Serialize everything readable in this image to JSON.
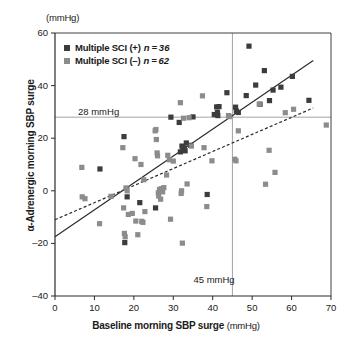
{
  "figure": {
    "unit_top": "(mmHg)",
    "x_axis_title": "Baseline morning SBP surge",
    "x_axis_unit": "(mmHg)",
    "y_axis_title": "α-Adrenergic morning SBP surge"
  },
  "legend": {
    "items": [
      {
        "label": "Multiple SCI (+)",
        "n_text": "n = 36",
        "color": "#3c3c3c",
        "marker": "square-marker"
      },
      {
        "label": "Multiple SCI (–)",
        "n_text": "n = 62",
        "color": "#8c8c8c",
        "marker": "square-marker"
      }
    ]
  },
  "annotations": {
    "h_ref_label": "28 mmHg",
    "v_ref_label": "45 mmHg"
  },
  "chart_data": {
    "type": "scatter",
    "title": "",
    "xlabel": "Baseline morning SBP surge (mmHg)",
    "ylabel": "α-Adrenergic morning SBP surge (mmHg)",
    "xlim": [
      0,
      70
    ],
    "ylim": [
      -40,
      60
    ],
    "xticks": [
      0,
      10,
      20,
      30,
      40,
      50,
      60,
      70
    ],
    "yticks": [
      -40,
      -20,
      0,
      20,
      40,
      60
    ],
    "grid": false,
    "legend_position": "top-left",
    "reference_lines": [
      {
        "name": "h-ref-28",
        "orientation": "horizontal",
        "value": 28,
        "label": "28 mmHg",
        "color": "#8c8c8c"
      },
      {
        "name": "v-ref-45",
        "orientation": "vertical",
        "value": 45,
        "label": "45 mmHg",
        "color": "#8c8c8c"
      }
    ],
    "fit_lines": [
      {
        "name": "sci-positive-fit",
        "style": "solid",
        "color": "#2b2b2b",
        "x": [
          0,
          65.5
        ],
        "y": [
          -17.5,
          49.5
        ]
      },
      {
        "name": "sci-negative-fit",
        "style": "dashed",
        "color": "#2b2b2b",
        "x": [
          0,
          65.5
        ],
        "y": [
          -11.0,
          31.5
        ]
      }
    ],
    "series": [
      {
        "name": "Multiple SCI (+)",
        "n": 36,
        "color": "#3c3c3c",
        "marker": "square",
        "points": [
          [
            11.4,
            8.3
          ],
          [
            17.5,
            20.6
          ],
          [
            17.7,
            -19.7
          ],
          [
            18.3,
            -2.3
          ],
          [
            21.5,
            -4.5
          ],
          [
            25.5,
            -6.5
          ],
          [
            29.4,
            28.0
          ],
          [
            31.5,
            26.0
          ],
          [
            31.8,
            14.8
          ],
          [
            32.2,
            17.0
          ],
          [
            32.4,
            16.6
          ],
          [
            32.8,
            16.2
          ],
          [
            33.0,
            15.2
          ],
          [
            33.3,
            18.2
          ],
          [
            34.4,
            17.3
          ],
          [
            35.0,
            28.1
          ],
          [
            38.6,
            -1.4
          ],
          [
            40.4,
            29.0
          ],
          [
            41.0,
            31.9
          ],
          [
            41.2,
            29.8
          ],
          [
            41.3,
            28.6
          ],
          [
            41.6,
            32.0
          ],
          [
            43.6,
            37.3
          ],
          [
            45.8,
            31.8
          ],
          [
            46.0,
            30.3
          ],
          [
            46.5,
            29.8
          ],
          [
            48.5,
            36.2
          ],
          [
            49.2,
            55.0
          ],
          [
            50.9,
            40.2
          ],
          [
            52.0,
            32.9
          ],
          [
            53.1,
            45.7
          ],
          [
            54.4,
            34.3
          ],
          [
            55.3,
            38.3
          ],
          [
            57.3,
            39.4
          ],
          [
            60.2,
            43.5
          ],
          [
            64.4,
            34.4
          ]
        ]
      },
      {
        "name": "Multiple SCI (–)",
        "n": 62,
        "color": "#8c8c8c",
        "marker": "square",
        "points": [
          [
            6.8,
            8.9
          ],
          [
            6.9,
            -2.3
          ],
          [
            7.6,
            -3.0
          ],
          [
            11.3,
            -12.5
          ],
          [
            14.2,
            -2.1
          ],
          [
            17.2,
            16.4
          ],
          [
            17.4,
            -6.5
          ],
          [
            17.6,
            -16.2
          ],
          [
            17.8,
            -17.5
          ],
          [
            18.0,
            1.1
          ],
          [
            18.3,
            0.0
          ],
          [
            18.6,
            -9.0
          ],
          [
            19.6,
            -8.6
          ],
          [
            20.3,
            12.2
          ],
          [
            20.5,
            -11.5
          ],
          [
            21.0,
            -16.7
          ],
          [
            21.8,
            10.0
          ],
          [
            22.0,
            -11.6
          ],
          [
            22.3,
            -12.0
          ],
          [
            22.5,
            4.2
          ],
          [
            22.8,
            -7.9
          ],
          [
            25.4,
            22.8
          ],
          [
            25.6,
            23.3
          ],
          [
            25.7,
            19.5
          ],
          [
            25.9,
            14.4
          ],
          [
            26.0,
            13.3
          ],
          [
            26.2,
            -0.8
          ],
          [
            26.3,
            -2.0
          ],
          [
            26.5,
            0.5
          ],
          [
            26.8,
            -3.2
          ],
          [
            27.0,
            0.8
          ],
          [
            27.3,
            -0.4
          ],
          [
            27.6,
            1.2
          ],
          [
            28.3,
            6.0
          ],
          [
            28.6,
            13.5
          ],
          [
            29.0,
            11.8
          ],
          [
            29.3,
            -10.8
          ],
          [
            30.0,
            11.3
          ],
          [
            31.8,
            33.5
          ],
          [
            32.0,
            -1.0
          ],
          [
            32.1,
            0.0
          ],
          [
            32.3,
            -19.9
          ],
          [
            32.6,
            27.6
          ],
          [
            33.5,
            2.6
          ],
          [
            34.0,
            27.8
          ],
          [
            34.6,
            17.0
          ],
          [
            37.4,
            36.1
          ],
          [
            37.8,
            16.4
          ],
          [
            38.5,
            -6.0
          ],
          [
            39.8,
            11.4
          ],
          [
            44.0,
            28.6
          ],
          [
            44.2,
            28.2
          ],
          [
            45.6,
            12.0
          ],
          [
            45.9,
            11.4
          ],
          [
            46.5,
            22.8
          ],
          [
            51.8,
            33.0
          ],
          [
            53.4,
            2.5
          ],
          [
            54.3,
            15.4
          ],
          [
            55.8,
            7.0
          ],
          [
            58.4,
            29.7
          ],
          [
            60.5,
            31.0
          ],
          [
            68.8,
            25.0
          ]
        ]
      }
    ]
  }
}
